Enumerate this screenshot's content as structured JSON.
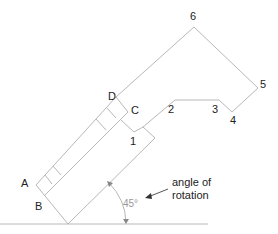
{
  "diagram": {
    "type": "technical-geometry",
    "point_labels": {
      "A": "A",
      "B": "B",
      "C": "C",
      "D": "D",
      "p1": "1",
      "p2": "2",
      "p3": "3",
      "p4": "4",
      "p5": "5",
      "p6": "6"
    },
    "annotation": {
      "line1": "angle of",
      "line2": "rotation"
    },
    "angle_label": "45°",
    "colors": {
      "outline": "#b8b8b8",
      "arrow": "#555555",
      "text": "#222222",
      "angle_text": "#999999"
    }
  }
}
